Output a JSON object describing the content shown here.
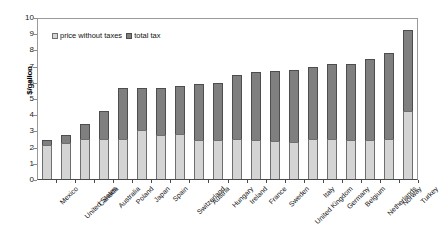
{
  "chart_data": {
    "type": "bar",
    "title": "",
    "subtitle": "",
    "xlabel": "",
    "ylabel": "$/gallon",
    "ylim": [
      0,
      10
    ],
    "yticks": [
      0,
      1,
      2,
      3,
      4,
      5,
      6,
      7,
      8,
      9,
      10
    ],
    "grid": false,
    "stacked": true,
    "legend_position": "top-left",
    "categories": [
      "Mexico",
      "United States",
      "Canada",
      "Australia",
      "Poland",
      "Japan",
      "Spain",
      "Switzerland",
      "Austria",
      "Hungary",
      "Ireland",
      "France",
      "Sweden",
      "United Kingdom",
      "Italy",
      "Germany",
      "Belgium",
      "Netherlands",
      "Norway",
      "Turkey"
    ],
    "series": [
      {
        "name": "price without taxes",
        "color": "#d4d4d4",
        "values": [
          2.1,
          2.2,
          2.45,
          2.5,
          2.5,
          3.0,
          2.7,
          2.75,
          2.4,
          2.4,
          2.45,
          2.4,
          2.35,
          2.3,
          2.5,
          2.45,
          2.4,
          2.4,
          2.5,
          4.2
        ]
      },
      {
        "name": "total tax",
        "color": "#7f7f7f",
        "values": [
          0.3,
          0.5,
          0.95,
          1.7,
          3.1,
          2.6,
          2.9,
          3.0,
          3.45,
          3.5,
          4.0,
          4.2,
          4.3,
          4.4,
          4.4,
          4.65,
          4.7,
          5.0,
          5.3,
          5.0
        ]
      }
    ],
    "totals": [
      2.4,
      2.7,
      3.4,
      4.2,
      5.6,
      5.6,
      5.6,
      5.75,
      5.85,
      5.9,
      6.45,
      6.6,
      6.65,
      6.7,
      6.9,
      7.1,
      7.1,
      7.4,
      7.8,
      9.2
    ]
  },
  "legend": {
    "items": [
      {
        "label": "price without taxes",
        "swatch": "price-swatch"
      },
      {
        "label": "total tax",
        "swatch": "tax-swatch"
      }
    ]
  },
  "colors": {
    "price": "#d4d4d4",
    "tax": "#7f7f7f",
    "axis": "#4a4a4a",
    "background": "#ffffff"
  }
}
